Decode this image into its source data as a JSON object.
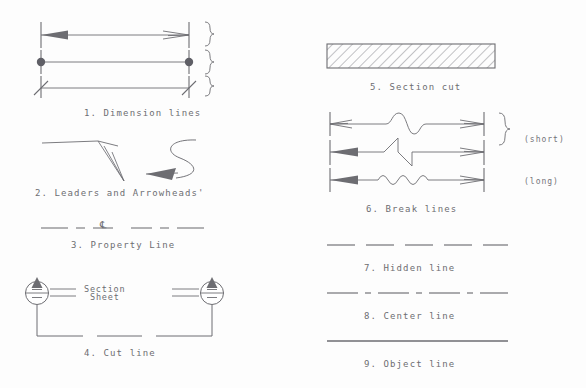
{
  "sheet": {
    "title": "Architectural line types reference sheet",
    "background_color": "#fdfdfd",
    "ink_color": "#6d6d72"
  },
  "left_column": {
    "items": [
      {
        "number": "1",
        "caption": "1. Dimension lines",
        "variants": [
          "arrowhead terminator",
          "dot terminator",
          "slash terminator"
        ]
      },
      {
        "number": "2",
        "caption": "2. Leaders and Arrowheads'",
        "variants": [
          "straight leader with open arrowhead",
          "curved S leader with solid arrowhead"
        ]
      },
      {
        "number": "3",
        "caption": "3. Property Line",
        "symbol": "℄"
      },
      {
        "number": "4",
        "caption": "4. Cut line",
        "marker_top_label": "Section",
        "marker_bottom_label": "Sheet"
      }
    ]
  },
  "right_column": {
    "items": [
      {
        "number": "5",
        "caption": "5. Section cut",
        "fill": "diagonal hatch"
      },
      {
        "number": "6",
        "caption": "6. Break lines",
        "variants": [
          "curved break",
          "zigzag break",
          "wavy break"
        ],
        "brace_label": "(short)",
        "second_label": "(long)"
      },
      {
        "number": "7",
        "caption": "7. Hidden line",
        "pattern": "dashed"
      },
      {
        "number": "8",
        "caption": "8. Center line",
        "pattern": "long dash short dash"
      },
      {
        "number": "9",
        "caption": "9. Object line",
        "pattern": "solid"
      }
    ]
  }
}
